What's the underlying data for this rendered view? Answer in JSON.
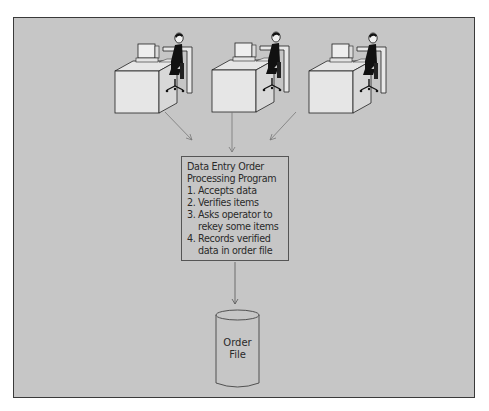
{
  "diagram": {
    "workstations": [
      {
        "id": "workstation-1",
        "label": "Operator workstation 1"
      },
      {
        "id": "workstation-2",
        "label": "Operator workstation 2"
      },
      {
        "id": "workstation-3",
        "label": "Operator workstation 3"
      }
    ],
    "program": {
      "title": "Data Entry Order Processing Program",
      "title_line1": "Data Entry Order",
      "title_line2": "Processing Program",
      "steps": [
        {
          "num": "1.",
          "text": "Accepts data"
        },
        {
          "num": "2.",
          "text": "Verifies items"
        },
        {
          "num": "3.",
          "text": "Asks operator to rekey some items"
        },
        {
          "num": "4.",
          "text": "Records verified data in order file"
        }
      ]
    },
    "storage": {
      "line1": "Order",
      "line2": "File"
    },
    "colors": {
      "background": "#c6c6c6",
      "lines": "#333333",
      "arrows": "#777777"
    }
  }
}
